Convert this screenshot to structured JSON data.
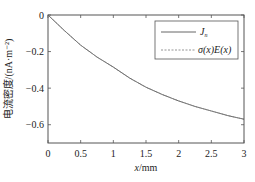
{
  "chart_data": {
    "type": "line",
    "title": "",
    "xlabel_italic": "x",
    "xlabel_rest": "/mm",
    "ylabel": "电流密度/(nA·m⁻²)",
    "xlim": [
      0,
      3
    ],
    "ylim": [
      -0.7,
      0
    ],
    "xticks": [
      0,
      0.5,
      1,
      1.5,
      2,
      2.5,
      3
    ],
    "xtick_labels": [
      "0",
      "0.5",
      "1",
      "1.5",
      "2",
      "2.5",
      "3"
    ],
    "yticks": [
      0,
      -0.2,
      -0.4,
      -0.6
    ],
    "ytick_labels": [
      "0",
      "−0.2",
      "−0.4",
      "−0.6"
    ],
    "grid": false,
    "legend_position": "top-right",
    "x": [
      0,
      0.25,
      0.5,
      0.75,
      1,
      1.25,
      1.5,
      1.75,
      2,
      2.25,
      2.5,
      2.75,
      3
    ],
    "series": [
      {
        "name": "J_n",
        "label_main": "J",
        "label_sub": "n",
        "style": "solid",
        "color": "#555555",
        "values": [
          0,
          -0.085,
          -0.165,
          -0.23,
          -0.285,
          -0.345,
          -0.395,
          -0.435,
          -0.47,
          -0.5,
          -0.525,
          -0.55,
          -0.57
        ]
      },
      {
        "name": "σ(x)E(x)",
        "label_main": "σ(x)E(x)",
        "style": "dashed",
        "color": "#888888",
        "values": [
          0,
          -0.085,
          -0.165,
          -0.23,
          -0.285,
          -0.345,
          -0.395,
          -0.435,
          -0.47,
          -0.5,
          -0.525,
          -0.55,
          -0.57
        ]
      }
    ]
  }
}
